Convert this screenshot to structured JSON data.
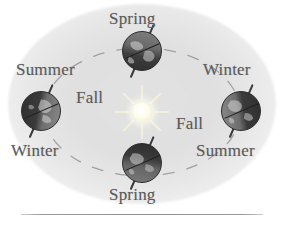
{
  "figure": {
    "type": "seasons-earth-orbit-diagram",
    "sun": {
      "name": "sun",
      "color": "#f7f5d8"
    },
    "background_ellipse_color": "#e2e2e2",
    "orbit": {
      "style": "dashed",
      "color": "#9a9a9a"
    },
    "label_color": "#5a5a5a",
    "rule_color": "#8f8f8f"
  },
  "globes": [
    {
      "id": "globe-top",
      "position": "top",
      "lighting": "lit-up"
    },
    {
      "id": "globe-left",
      "position": "left",
      "lighting": "lit-right"
    },
    {
      "id": "globe-right",
      "position": "right",
      "lighting": "lit-left"
    },
    {
      "id": "globe-bottom",
      "position": "bottom",
      "lighting": "lit-down"
    }
  ],
  "labels": {
    "top_spring": "Spring",
    "upper_left_summer": "Summer",
    "upper_right_winter": "Winter",
    "center_left_fall": "Fall",
    "center_right_fall": "Fall",
    "lower_left_winter": "Winter",
    "lower_right_summer": "Summer",
    "bottom_spring": "Spring"
  }
}
